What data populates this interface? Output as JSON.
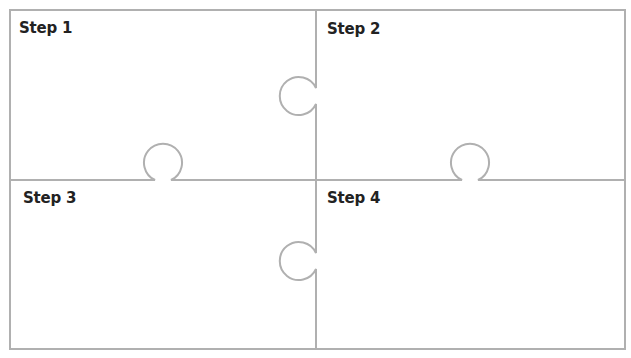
{
  "diagram": {
    "type": "puzzle-4-pieces",
    "stroke_color": "#b0b0b0",
    "background": "#ffffff",
    "pieces": [
      {
        "id": 1,
        "label": "Step 1"
      },
      {
        "id": 2,
        "label": "Step 2"
      },
      {
        "id": 3,
        "label": "Step 3"
      },
      {
        "id": 4,
        "label": "Step 4"
      }
    ]
  }
}
